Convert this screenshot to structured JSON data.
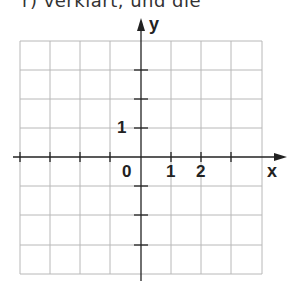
{
  "header": {
    "clipped_text": "r) verklärt, und die"
  },
  "diagram": {
    "type": "coordinate-grid",
    "x_axis_label": "x",
    "y_axis_label": "y",
    "origin_label": "0",
    "x_tick_labels": [
      "1",
      "2"
    ],
    "y_tick_labels": [
      "1"
    ],
    "grid_columns": 8,
    "grid_rows": 8,
    "x_range": [
      -4,
      4
    ],
    "y_range": [
      -4,
      4
    ],
    "colors": {
      "grid": "#b8b8b8",
      "axis": "#222222",
      "text": "#222222"
    }
  }
}
